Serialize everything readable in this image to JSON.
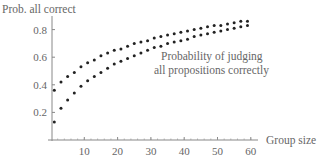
{
  "chart_data": {
    "type": "scatter",
    "title": "",
    "ylabel": "Prob. all correct",
    "xlabel": "Group size",
    "annotation": [
      "Probability of judging",
      "all propositions correctly"
    ],
    "xlim": [
      0,
      60
    ],
    "ylim": [
      0,
      0.9
    ],
    "xticks": [
      10,
      20,
      30,
      40,
      50,
      60
    ],
    "yticks": [
      0.2,
      0.4,
      0.6,
      0.8
    ],
    "ytick_labels": [
      "0.2",
      "0.4",
      "0.6",
      "0.8"
    ],
    "xtick_labels": [
      "10",
      "20",
      "30",
      "40",
      "50",
      "60"
    ],
    "grid": false,
    "legend": null,
    "x": [
      1,
      3,
      5,
      7,
      9,
      11,
      13,
      15,
      17,
      19,
      21,
      23,
      25,
      27,
      29,
      31,
      33,
      35,
      37,
      39,
      41,
      43,
      45,
      47,
      49,
      51,
      53,
      55,
      57,
      59
    ],
    "series": [
      {
        "name": "upper",
        "values": [
          0.36,
          0.42,
          0.46,
          0.49,
          0.53,
          0.56,
          0.58,
          0.61,
          0.63,
          0.65,
          0.66,
          0.68,
          0.7,
          0.71,
          0.72,
          0.74,
          0.75,
          0.76,
          0.77,
          0.78,
          0.79,
          0.8,
          0.81,
          0.82,
          0.83,
          0.83,
          0.84,
          0.85,
          0.86,
          0.86
        ]
      },
      {
        "name": "lower",
        "values": [
          0.13,
          0.23,
          0.29,
          0.34,
          0.39,
          0.43,
          0.46,
          0.49,
          0.52,
          0.55,
          0.57,
          0.59,
          0.61,
          0.63,
          0.65,
          0.67,
          0.68,
          0.7,
          0.71,
          0.72,
          0.73,
          0.75,
          0.76,
          0.77,
          0.78,
          0.79,
          0.8,
          0.81,
          0.82,
          0.83
        ]
      }
    ]
  }
}
